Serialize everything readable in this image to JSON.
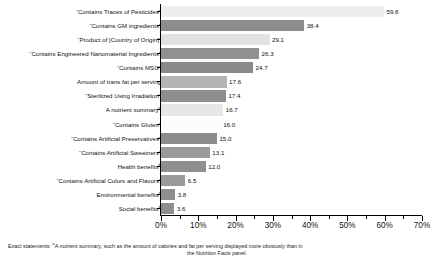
{
  "chart_data": {
    "type": "bar",
    "orientation": "horizontal",
    "title": "",
    "subtitle": "",
    "xlabel": "",
    "ylabel": "",
    "xlim": [
      0,
      70
    ],
    "xtick_labels": [
      "0%",
      "10%",
      "20%",
      "30%",
      "40%",
      "50%",
      "60%",
      "70%"
    ],
    "xtick_values": [
      0,
      10,
      20,
      30,
      40,
      50,
      60,
      70
    ],
    "minor_tick_step": 5,
    "grid": false,
    "legend": "none",
    "value_suffix": "",
    "categories": [
      "“Contains Traces of Pesticides”",
      "“Contains GM ingredients”",
      "“Product of [Country of Origin]”",
      "“Contains Engineered Nanomaterial Ingredients”",
      "“Contains MSG”",
      "Amount of trans fat per serving",
      "“Sterilized Using Irradiation”",
      "A nutrient summary",
      "“Contains Gluten”",
      "“Contains Artificial Preservatives”",
      "“Contains Artificial Sweetners”",
      "Health benefits",
      "“Contains Artificial Colors and Flavors”",
      "Environmental benefits",
      "Social benefits"
    ],
    "category_footnote_marks": [
      "",
      "",
      "",
      "",
      "",
      "",
      "",
      "a",
      "",
      "",
      "",
      "b",
      "",
      "c",
      "d"
    ],
    "values": [
      59.8,
      38.4,
      29.1,
      26.3,
      24.7,
      17.6,
      17.4,
      16.7,
      16.0,
      15.0,
      13.1,
      12.0,
      6.5,
      3.8,
      3.6
    ],
    "value_labels": [
      "59.8",
      "38.4",
      "29.1",
      "26.3",
      "24.7",
      "17.6",
      "17.4",
      "16.7",
      "16.0",
      "15.0",
      "13.1",
      "12.0",
      "6.5",
      "3.8",
      "3.6"
    ],
    "bar_colors": [
      "#eeeeee",
      "#8d8d8d",
      "#e2e2e2",
      "#909090",
      "#8a8a8a",
      "#b5b5b5",
      "#8d8d8d",
      "#e7e7e7",
      "#fcfcfc",
      "#8c8c8c",
      "#9a9a9a",
      "#8f8f8f",
      "#9a9a9a",
      "#8f8f8f",
      "#8f8f8f"
    ]
  },
  "footnote": {
    "lead": "Exact statements: ",
    "mark": "a",
    "line1": "A nutrient summary, such as the amount of calories and fat per serving displayed more obviously than in",
    "line2": "the Nutrition Facts panel."
  }
}
